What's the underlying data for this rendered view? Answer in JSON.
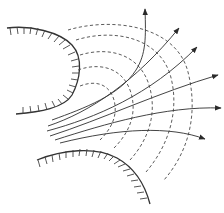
{
  "diagram": {
    "type": "flow-net",
    "colors": {
      "line": "#333333",
      "background": "#ffffff"
    },
    "walls": [
      {
        "id": "upper-wall",
        "path": "M7,28 C30,25 60,32 72,45 C84,58 80,80 72,95 C64,108 40,112 16,114",
        "hatch_side": "left"
      },
      {
        "id": "lower-wall",
        "path": "M37,160 C62,150 95,146 117,158 C135,168 145,185 150,204",
        "hatch_side": "below"
      }
    ],
    "streamlines": [
      {
        "id": "s1",
        "path": "M52,148 C90,128 130,110 145,70 C148,55 147,40 145,10",
        "arrow": [
          145,
          10
        ]
      },
      {
        "id": "s2",
        "path": "M48,140 C90,120 135,90 178,28",
        "arrow": [
          178,
          28
        ]
      },
      {
        "id": "s3",
        "path": "M47,131 C92,118 150,95 196,47",
        "arrow": [
          196,
          47
        ]
      },
      {
        "id": "s4",
        "path": "M48,124 C100,112 160,92 218,75",
        "arrow": [
          218,
          75
        ]
      },
      {
        "id": "s5",
        "path": "M52,116 C105,108 165,103 220,108",
        "arrow": [
          220,
          108
        ]
      },
      {
        "id": "s6",
        "path": "M58,137 C120,122 170,124 205,139",
        "arrow": [
          205,
          139
        ]
      }
    ],
    "equipotentials": [
      {
        "id": "e1",
        "path": "M73,60 C100,50 120,55 130,80 C138,100 132,120 112,138"
      },
      {
        "id": "e2",
        "path": "M80,46 C110,38 140,45 150,75 C160,105 150,130 128,150"
      },
      {
        "id": "e3",
        "path": "M78,34 C115,25 160,30 172,70 C182,105 170,140 145,170"
      },
      {
        "id": "e4",
        "path": "M68,27 C110,15 175,20 188,70 C198,110 190,150 168,180"
      },
      {
        "id": "e5",
        "path": "M80,85 C98,78 112,85 116,100 C120,115 112,128 100,140"
      }
    ]
  }
}
